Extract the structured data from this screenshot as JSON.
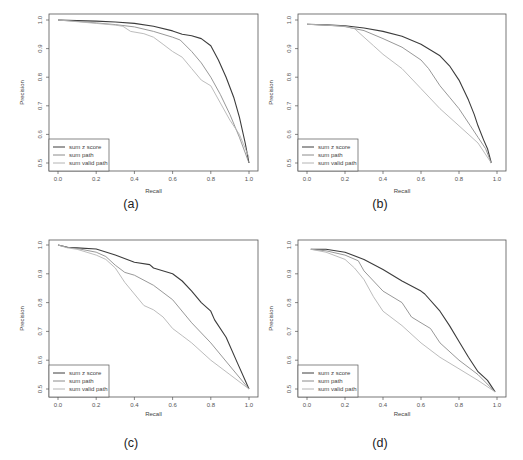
{
  "top_fragment_text": "",
  "colors": {
    "sum_z_score": "#3c3c3c",
    "sum_path": "#8c8c8c",
    "sum_valid_path": "#b4b4b4",
    "frame": "#555555"
  },
  "chart_data": [
    {
      "id": "a",
      "caption": "(a)",
      "type": "line",
      "title": "",
      "xlabel": "Recall",
      "ylabel": "Precision",
      "xlim": [
        0.0,
        1.0
      ],
      "ylim": [
        0.5,
        1.0
      ],
      "xticks": [
        "0.0",
        "0.2",
        "0.4",
        "0.6",
        "0.8",
        "1.0"
      ],
      "yticks": [
        "0.5",
        "0.6",
        "0.7",
        "0.8",
        "0.9",
        "1.0"
      ],
      "grid": false,
      "legend_position": "bottom-left",
      "series": [
        {
          "name": "sum z score",
          "color_key": "sum_z_score",
          "x": [
            0.0,
            0.1,
            0.2,
            0.3,
            0.4,
            0.5,
            0.6,
            0.65,
            0.7,
            0.75,
            0.8,
            0.84,
            0.88,
            0.92,
            0.95,
            0.98,
            1.0
          ],
          "y": [
            1.0,
            0.998,
            0.996,
            0.993,
            0.988,
            0.978,
            0.962,
            0.95,
            0.945,
            0.935,
            0.91,
            0.86,
            0.8,
            0.73,
            0.66,
            0.57,
            0.5
          ]
        },
        {
          "name": "sum path",
          "color_key": "sum_path",
          "x": [
            0.0,
            0.1,
            0.2,
            0.3,
            0.4,
            0.5,
            0.6,
            0.64,
            0.7,
            0.75,
            0.8,
            0.85,
            0.9,
            0.95,
            1.0
          ],
          "y": [
            1.0,
            0.995,
            0.99,
            0.984,
            0.976,
            0.96,
            0.94,
            0.93,
            0.89,
            0.85,
            0.8,
            0.74,
            0.67,
            0.59,
            0.5
          ]
        },
        {
          "name": "sum valid path",
          "color_key": "sum_valid_path",
          "x": [
            0.0,
            0.1,
            0.2,
            0.3,
            0.34,
            0.38,
            0.45,
            0.5,
            0.55,
            0.6,
            0.65,
            0.7,
            0.75,
            0.8,
            0.85,
            0.9,
            0.95,
            1.0
          ],
          "y": [
            1.0,
            0.994,
            0.988,
            0.982,
            0.978,
            0.96,
            0.952,
            0.94,
            0.915,
            0.89,
            0.87,
            0.83,
            0.79,
            0.77,
            0.71,
            0.65,
            0.6,
            0.52
          ]
        }
      ]
    },
    {
      "id": "b",
      "caption": "(b)",
      "type": "line",
      "title": "",
      "xlabel": "Recall",
      "ylabel": "Precision",
      "xlim": [
        0.0,
        1.0
      ],
      "ylim": [
        0.5,
        1.0
      ],
      "xticks": [
        "0.0",
        "0.2",
        "0.4",
        "0.6",
        "0.8",
        "1.0"
      ],
      "yticks": [
        "0.5",
        "0.6",
        "0.7",
        "0.8",
        "0.9",
        "1.0"
      ],
      "grid": false,
      "legend_position": "bottom-left",
      "series": [
        {
          "name": "sum z score",
          "color_key": "sum_z_score",
          "x": [
            0.0,
            0.1,
            0.2,
            0.3,
            0.4,
            0.5,
            0.6,
            0.65,
            0.7,
            0.75,
            0.8,
            0.85,
            0.88,
            0.9,
            0.93,
            0.95,
            0.97
          ],
          "y": [
            0.985,
            0.983,
            0.98,
            0.972,
            0.96,
            0.943,
            0.915,
            0.895,
            0.875,
            0.84,
            0.79,
            0.72,
            0.67,
            0.63,
            0.58,
            0.55,
            0.5
          ]
        },
        {
          "name": "sum path",
          "color_key": "sum_path",
          "x": [
            0.0,
            0.1,
            0.2,
            0.3,
            0.4,
            0.5,
            0.6,
            0.64,
            0.7,
            0.75,
            0.8,
            0.86,
            0.9,
            0.94,
            0.97
          ],
          "y": [
            0.985,
            0.982,
            0.977,
            0.963,
            0.935,
            0.905,
            0.86,
            0.83,
            0.77,
            0.73,
            0.69,
            0.63,
            0.59,
            0.55,
            0.5
          ]
        },
        {
          "name": "sum valid path",
          "color_key": "sum_valid_path",
          "x": [
            0.0,
            0.1,
            0.2,
            0.25,
            0.3,
            0.35,
            0.4,
            0.5,
            0.6,
            0.7,
            0.8,
            0.9,
            0.97
          ],
          "y": [
            0.985,
            0.982,
            0.978,
            0.97,
            0.94,
            0.91,
            0.88,
            0.83,
            0.76,
            0.69,
            0.63,
            0.57,
            0.5
          ]
        }
      ]
    },
    {
      "id": "c",
      "caption": "(c)",
      "type": "line",
      "title": "",
      "xlabel": "Recall",
      "ylabel": "Precision",
      "xlim": [
        0.0,
        1.0
      ],
      "ylim": [
        0.5,
        1.0
      ],
      "xticks": [
        "0.0",
        "0.2",
        "0.4",
        "0.6",
        "0.8",
        "1.0"
      ],
      "yticks": [
        "0.5",
        "0.6",
        "0.7",
        "0.8",
        "0.9",
        "1.0"
      ],
      "grid": false,
      "legend_position": "bottom-left",
      "series": [
        {
          "name": "sum z score",
          "color_key": "sum_z_score",
          "x": [
            0.0,
            0.05,
            0.1,
            0.2,
            0.3,
            0.4,
            0.48,
            0.5,
            0.6,
            0.65,
            0.7,
            0.75,
            0.8,
            0.82,
            0.88,
            0.94,
            1.0
          ],
          "y": [
            1.0,
            0.992,
            0.99,
            0.986,
            0.965,
            0.94,
            0.932,
            0.92,
            0.9,
            0.875,
            0.84,
            0.8,
            0.77,
            0.74,
            0.68,
            0.59,
            0.5
          ]
        },
        {
          "name": "sum path",
          "color_key": "sum_path",
          "x": [
            0.0,
            0.05,
            0.1,
            0.2,
            0.25,
            0.3,
            0.35,
            0.4,
            0.5,
            0.6,
            0.7,
            0.8,
            0.9,
            1.0
          ],
          "y": [
            1.0,
            0.992,
            0.988,
            0.975,
            0.96,
            0.93,
            0.905,
            0.895,
            0.86,
            0.81,
            0.73,
            0.66,
            0.58,
            0.5
          ]
        },
        {
          "name": "sum valid path",
          "color_key": "sum_valid_path",
          "x": [
            0.0,
            0.05,
            0.1,
            0.2,
            0.25,
            0.3,
            0.35,
            0.4,
            0.45,
            0.5,
            0.55,
            0.6,
            0.65,
            0.7,
            0.8,
            0.9,
            1.0
          ],
          "y": [
            1.0,
            0.99,
            0.985,
            0.965,
            0.95,
            0.92,
            0.87,
            0.83,
            0.79,
            0.775,
            0.75,
            0.71,
            0.685,
            0.66,
            0.6,
            0.55,
            0.5
          ]
        }
      ]
    },
    {
      "id": "d",
      "caption": "(d)",
      "type": "line",
      "title": "",
      "xlabel": "Recall",
      "ylabel": "Precision",
      "xlim": [
        0.0,
        1.0
      ],
      "ylim": [
        0.5,
        1.0
      ],
      "xticks": [
        "0.0",
        "0.2",
        "0.4",
        "0.6",
        "0.8",
        "1.0"
      ],
      "yticks": [
        "0.5",
        "0.6",
        "0.7",
        "0.8",
        "0.9",
        "1.0"
      ],
      "grid": false,
      "legend_position": "bottom-left",
      "series": [
        {
          "name": "sum z score",
          "color_key": "sum_z_score",
          "x": [
            0.02,
            0.1,
            0.2,
            0.3,
            0.4,
            0.5,
            0.6,
            0.62,
            0.7,
            0.75,
            0.8,
            0.85,
            0.9,
            0.95,
            0.99
          ],
          "y": [
            0.985,
            0.985,
            0.975,
            0.95,
            0.915,
            0.875,
            0.84,
            0.83,
            0.77,
            0.72,
            0.665,
            0.61,
            0.56,
            0.53,
            0.49
          ]
        },
        {
          "name": "sum path",
          "color_key": "sum_path",
          "x": [
            0.02,
            0.1,
            0.2,
            0.27,
            0.3,
            0.4,
            0.5,
            0.55,
            0.6,
            0.65,
            0.7,
            0.8,
            0.9,
            0.99
          ],
          "y": [
            0.985,
            0.98,
            0.965,
            0.945,
            0.91,
            0.84,
            0.8,
            0.75,
            0.73,
            0.71,
            0.66,
            0.6,
            0.55,
            0.49
          ]
        },
        {
          "name": "sum valid path",
          "color_key": "sum_valid_path",
          "x": [
            0.02,
            0.1,
            0.2,
            0.25,
            0.3,
            0.35,
            0.4,
            0.5,
            0.6,
            0.7,
            0.8,
            0.9,
            0.99
          ],
          "y": [
            0.985,
            0.975,
            0.95,
            0.92,
            0.88,
            0.82,
            0.77,
            0.72,
            0.66,
            0.61,
            0.57,
            0.53,
            0.49
          ]
        }
      ]
    }
  ]
}
